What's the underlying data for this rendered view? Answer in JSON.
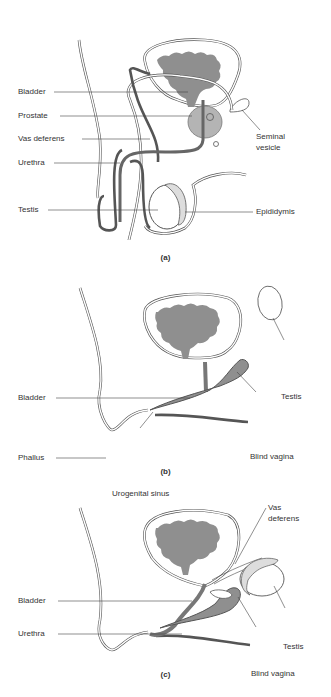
{
  "figure": {
    "panels": [
      {
        "caption": "(a)",
        "labels": {
          "bladder": "Bladder",
          "prostate": "Prostate",
          "vas_deferens": "Vas deferens",
          "urethra": "Urethra",
          "testis": "Testis",
          "seminal_vesicle_1": "Seminal",
          "seminal_vesicle_2": "vesicle",
          "epididymis": "Epididymis"
        }
      },
      {
        "caption": "(b)",
        "labels": {
          "bladder": "Bladder",
          "phallus": "Phallus",
          "testis": "Testis",
          "blind_vagina": "Blind vagina",
          "urogenital_sinus": "Urogenital sinus"
        }
      },
      {
        "caption": "(c)",
        "labels": {
          "bladder": "Bladder",
          "urethra": "Urethra",
          "vas_deferens_1": "Vas",
          "vas_deferens_2": "deferens",
          "testis": "Testis",
          "blind_vagina": "Blind vagina"
        }
      }
    ],
    "colors": {
      "organ_fill": "#8f8f8f",
      "prostate_fill": "#b4b4b4",
      "outline": "#555555",
      "background": "#ffffff"
    }
  }
}
